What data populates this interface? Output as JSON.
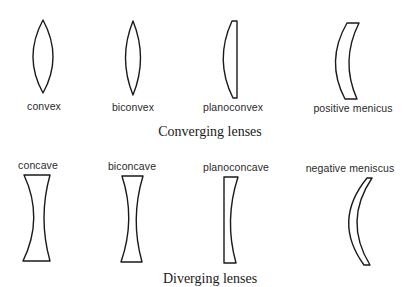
{
  "figure": {
    "converging": {
      "caption": "Converging lenses",
      "lenses": [
        {
          "name": "convex",
          "label": "convex"
        },
        {
          "name": "biconvex",
          "label": "biconvex"
        },
        {
          "name": "planoconvex",
          "label": "planoconvex"
        },
        {
          "name": "positive-meniscus",
          "label": "positive menicus"
        }
      ]
    },
    "diverging": {
      "caption": "Diverging lenses",
      "lenses": [
        {
          "name": "concave",
          "label": "concave"
        },
        {
          "name": "biconcave",
          "label": "biconcave"
        },
        {
          "name": "planoconcave",
          "label": "planoconcave"
        },
        {
          "name": "negative-meniscus",
          "label": "negative meniscus"
        }
      ]
    },
    "colors": {
      "stroke": "#1a1a1a",
      "background": "#ffffff",
      "text": "#2a2a2a"
    }
  }
}
